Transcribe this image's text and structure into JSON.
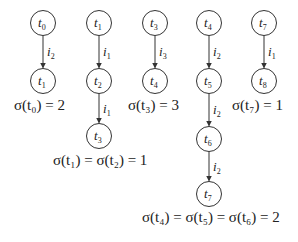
{
  "diagram": {
    "type": "chains",
    "chains": [
      {
        "nodes": [
          {
            "label": "t",
            "sub": "0",
            "x": 43,
            "y": 23
          },
          {
            "label": "t",
            "sub": "1",
            "x": 43,
            "y": 81
          }
        ],
        "edges": [
          {
            "label": "i",
            "sub": "2"
          }
        ],
        "formula": {
          "text": "σ(t₀) = 2",
          "x": 14,
          "y": 97
        }
      },
      {
        "nodes": [
          {
            "label": "t",
            "sub": "1",
            "x": 99,
            "y": 23
          },
          {
            "label": "t",
            "sub": "2",
            "x": 99,
            "y": 81
          },
          {
            "label": "t",
            "sub": "3",
            "x": 99,
            "y": 136
          }
        ],
        "edges": [
          {
            "label": "i",
            "sub": "1"
          },
          {
            "label": "i",
            "sub": "1"
          }
        ],
        "formula": {
          "text": "σ(t₁) = σ(t₂) = 1",
          "x": 53,
          "y": 152
        }
      },
      {
        "nodes": [
          {
            "label": "t",
            "sub": "3",
            "x": 155,
            "y": 23
          },
          {
            "label": "t",
            "sub": "4",
            "x": 155,
            "y": 81
          }
        ],
        "edges": [
          {
            "label": "i",
            "sub": "3"
          }
        ],
        "formula": {
          "text": "σ(t₃) = 3",
          "x": 128,
          "y": 97
        }
      },
      {
        "nodes": [
          {
            "label": "t",
            "sub": "4",
            "x": 209,
            "y": 23
          },
          {
            "label": "t",
            "sub": "5",
            "x": 209,
            "y": 81
          },
          {
            "label": "t",
            "sub": "6",
            "x": 209,
            "y": 139
          },
          {
            "label": "t",
            "sub": "7",
            "x": 209,
            "y": 194
          }
        ],
        "edges": [
          {
            "label": "i",
            "sub": "2"
          },
          {
            "label": "i",
            "sub": "2"
          },
          {
            "label": "i",
            "sub": "2"
          }
        ],
        "formula": {
          "text": "σ(t₄) = σ(t₅) = σ(t₆) = 2",
          "x": 142,
          "y": 209
        }
      },
      {
        "nodes": [
          {
            "label": "t",
            "sub": "7",
            "x": 264,
            "y": 23
          },
          {
            "label": "t",
            "sub": "8",
            "x": 264,
            "y": 81
          }
        ],
        "edges": [
          {
            "label": "i",
            "sub": "1"
          }
        ],
        "formula": {
          "text": "σ(t₇) = 1",
          "x": 232,
          "y": 97
        }
      }
    ]
  }
}
